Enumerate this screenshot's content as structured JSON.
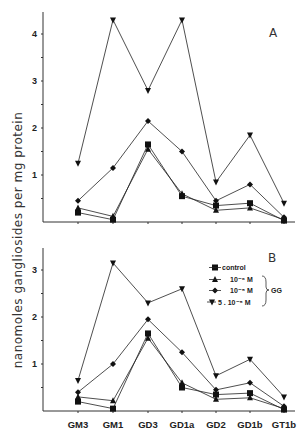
{
  "chart_data": [
    {
      "type": "line",
      "panel": "A",
      "title": "",
      "xlabel": "",
      "ylabel": "nanomoles gangliosides per mg protein",
      "ylim": [
        0,
        4.4
      ],
      "yticks": [
        1,
        2,
        3,
        4
      ],
      "categories": [
        "GM3",
        "GM1",
        "GD3",
        "GD1a",
        "GD2",
        "GD1b",
        "GT1b"
      ],
      "series": [
        {
          "name": "control",
          "marker": "square",
          "values": [
            0.2,
            0.05,
            1.65,
            0.55,
            0.35,
            0.4,
            0.03
          ]
        },
        {
          "name": "10-6 M",
          "marker": "triangle",
          "values": [
            0.3,
            0.12,
            1.55,
            0.6,
            0.25,
            0.3,
            0.05
          ]
        },
        {
          "name": "10-5 M",
          "marker": "diamond",
          "values": [
            0.45,
            1.15,
            2.15,
            1.5,
            0.45,
            0.8,
            0.1
          ]
        },
        {
          "name": "5.10-5 M",
          "marker": "inverted-triangle",
          "values": [
            1.25,
            4.3,
            2.8,
            4.3,
            0.85,
            1.85,
            0.4
          ]
        }
      ]
    },
    {
      "type": "line",
      "panel": "B",
      "title": "",
      "xlabel": "",
      "ylabel": "nanomoles gangliosides per mg protein",
      "ylim": [
        0,
        3.4
      ],
      "yticks": [
        1,
        2,
        3
      ],
      "categories": [
        "GM3",
        "GM1",
        "GD3",
        "GD1a",
        "GD2",
        "GD1b",
        "GT1b"
      ],
      "series": [
        {
          "name": "control",
          "marker": "square",
          "values": [
            0.2,
            0.05,
            1.65,
            0.5,
            0.35,
            0.38,
            0.03
          ]
        },
        {
          "name": "10-6 M",
          "marker": "triangle",
          "values": [
            0.3,
            0.22,
            1.55,
            0.6,
            0.25,
            0.28,
            0.05
          ]
        },
        {
          "name": "10-5 M",
          "marker": "diamond",
          "values": [
            0.4,
            1.0,
            1.95,
            1.25,
            0.45,
            0.6,
            0.1
          ]
        },
        {
          "name": "5.10-5 M",
          "marker": "inverted-triangle",
          "values": [
            0.65,
            3.15,
            2.3,
            2.6,
            0.75,
            1.1,
            0.3
          ]
        }
      ],
      "legend": {
        "position": "upper-right",
        "entries": [
          "control",
          "10⁻⁶ M",
          "10⁻⁵ M",
          "5 . 10⁻⁵ M"
        ],
        "group_label": "GG"
      }
    }
  ],
  "labels": {
    "ylabel": "nanomoles gangliosides per mg protein",
    "panel_a": "A",
    "panel_b": "B",
    "legend_control": "control",
    "legend_1": "10⁻⁶ M",
    "legend_2": "10⁻⁵ M",
    "legend_3": "5 . 10⁻⁵ M",
    "legend_group": "GG"
  }
}
